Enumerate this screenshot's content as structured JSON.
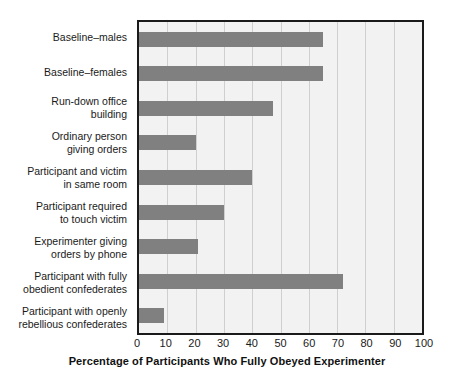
{
  "chart_data": {
    "type": "bar",
    "orientation": "horizontal",
    "title": "",
    "xlabel": "Percentage of Participants Who Fully Obeyed Experimenter",
    "ylabel": "",
    "xlim": [
      0,
      100
    ],
    "xticks": [
      0,
      10,
      20,
      30,
      40,
      50,
      60,
      70,
      80,
      90,
      100
    ],
    "grid": true,
    "legend": false,
    "categories": [
      "Baseline–males",
      "Baseline–females",
      "Run-down office\nbuilding",
      "Ordinary person\ngiving orders",
      "Participant and victim\nin same room",
      "Participant required\nto touch victim",
      "Experimenter giving\norders by phone",
      "Participant with fully\nobedient confederates",
      "Participant with openly\nrebellious confederates"
    ],
    "values": [
      65,
      65,
      47.5,
      20,
      40,
      30,
      21,
      72,
      9
    ],
    "series": [
      {
        "name": "Percentage fully obeyed",
        "values": [
          65,
          65,
          47.5,
          20,
          40,
          30,
          21,
          72,
          9
        ]
      }
    ]
  },
  "style": {
    "bar_color": "#808080",
    "plot_background": "#f2f2f2",
    "gridline_color": "#cfcfcf",
    "axis_border_color": "#1a1a1a",
    "page_background": "#ffffff",
    "text_color": "#1a1a1a"
  }
}
